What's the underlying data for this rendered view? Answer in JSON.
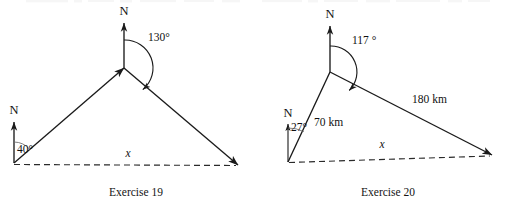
{
  "figure": {
    "type": "geometry-diagram-pair",
    "background_color": "#ffffff",
    "ink_color": "#1a1a1a",
    "figures": [
      {
        "id": "exercise-19",
        "caption": "Exercise 19",
        "north_labels": [
          "N",
          "N"
        ],
        "angles": [
          "40°",
          "130°"
        ],
        "side_labels": [
          "x"
        ],
        "vertices": {
          "origin": [
            14,
            163
          ],
          "apex": [
            124,
            68
          ],
          "terminus": [
            238,
            165
          ]
        },
        "bearing_from_origin_deg": 40,
        "bearing_at_apex_deg": 130,
        "unknown": "x",
        "baseline_style": "dashed"
      },
      {
        "id": "exercise-20",
        "caption": "Exercise 20",
        "north_labels": [
          "N",
          "N"
        ],
        "angles": [
          "27°",
          "117 °"
        ],
        "side_labels": [
          "70 km",
          "180 km",
          "x"
        ],
        "vertices": {
          "origin": [
            288,
            162
          ],
          "apex": [
            330,
            72
          ],
          "terminus": [
            492,
            155
          ]
        },
        "bearing_from_origin_deg": 27,
        "bearing_at_apex_deg": 117,
        "leg_1_length": "70 km",
        "leg_2_length": "180 km",
        "unknown": "x",
        "baseline_style": "dashed"
      }
    ]
  },
  "left": {
    "caption": "Exercise 19",
    "north_top": "N",
    "north_origin": "N",
    "angle_origin": "40°",
    "angle_apex": "130°",
    "base_label": "x"
  },
  "right": {
    "caption": "Exercise 20",
    "north_top": "N",
    "north_origin": "N",
    "angle_origin": "27°",
    "angle_apex": "117 °",
    "leg_label": "70 km",
    "hyp_label": "180 km",
    "base_label": "x"
  }
}
